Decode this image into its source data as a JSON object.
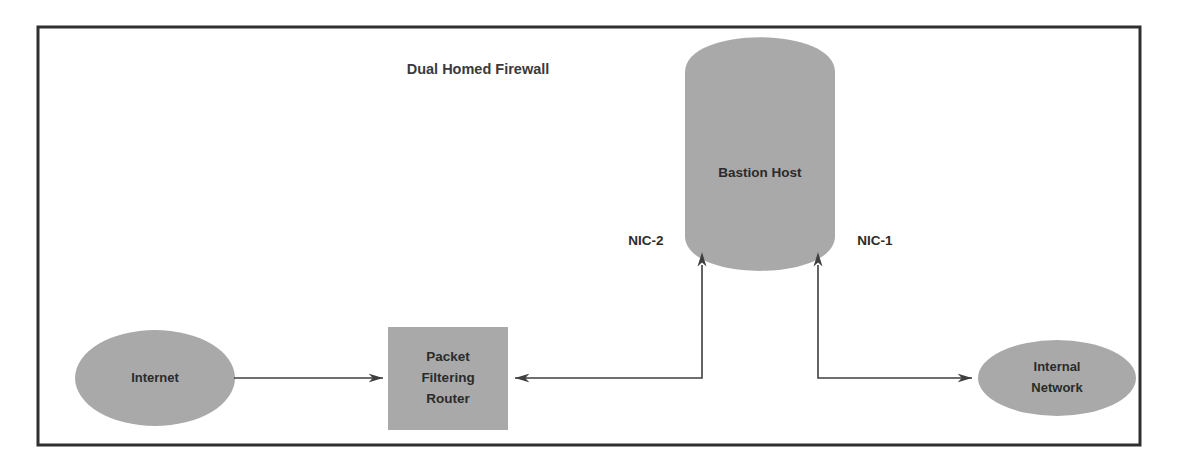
{
  "diagram": {
    "title": "Dual Homed Firewall",
    "frame": {
      "x": 38,
      "y": 27,
      "width": 1102,
      "height": 418,
      "border_color": "#2f2f2f"
    },
    "palette": {
      "shape_fill": "#a9a9a9",
      "text_color": "#2b2b2b",
      "connector_color": "#3f3f3f",
      "background": "#ffffff"
    },
    "nodes": [
      {
        "id": "internet",
        "label": "Internet",
        "shape": "ellipse",
        "cx": 155,
        "cy": 378,
        "rx": 80,
        "ry": 48,
        "font_size": 13
      },
      {
        "id": "packet-filtering-router",
        "label_lines": [
          "Packet",
          "Filtering",
          "Router"
        ],
        "shape": "rectangle",
        "x": 388,
        "y": 327,
        "width": 120,
        "height": 103,
        "font_size": 13.5
      },
      {
        "id": "bastion-host",
        "label": "Bastion Host",
        "shape": "cylinder",
        "x": 685,
        "y": 42,
        "width": 150,
        "height": 224,
        "font_size": 13.5
      },
      {
        "id": "internal-network",
        "label_lines": [
          "Internal",
          "Network"
        ],
        "shape": "ellipse",
        "cx": 1057,
        "cy": 378,
        "rx": 79,
        "ry": 38,
        "font_size": 13
      }
    ],
    "connectors": [
      {
        "id": "internet-to-router",
        "from": "internet",
        "to": "packet-filtering-router",
        "path": "M 234 378 L 383 378",
        "arrow_at": "end"
      },
      {
        "id": "bastion-nic2-to-router",
        "from": "bastion-host",
        "to": "packet-filtering-router",
        "path": "M 702 265 L 702 378 L 515 378",
        "arrow_at": "both"
      },
      {
        "id": "bastion-nic1-to-internal-network",
        "from": "bastion-host",
        "to": "internal-network",
        "path": "M 818 265 L 818 378 L 972 378",
        "arrow_at": "both"
      }
    ],
    "nic_labels": [
      {
        "id": "nic-2",
        "text": "NIC-2",
        "x": 646,
        "y": 245
      },
      {
        "id": "nic-1",
        "text": "NIC-1",
        "x": 875,
        "y": 245
      }
    ],
    "title_position": {
      "x": 478,
      "y": 74
    }
  }
}
